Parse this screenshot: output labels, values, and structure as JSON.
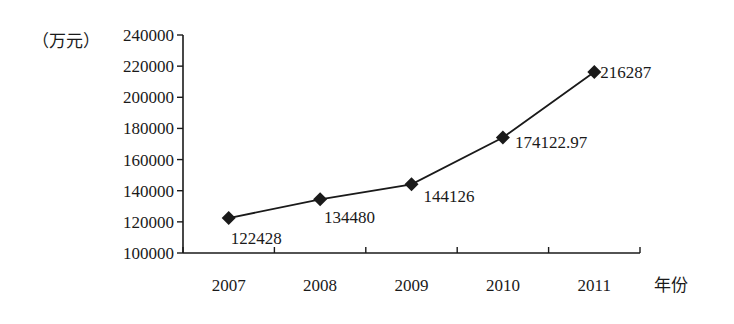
{
  "chart_data": {
    "type": "line",
    "title": "",
    "ylabel": "（万元）",
    "xlabel": "年份",
    "categories": [
      "2007",
      "2008",
      "2009",
      "2010",
      "2011"
    ],
    "series": [
      {
        "name": "",
        "values": [
          122428,
          134480,
          144126,
          174122.97,
          216287
        ],
        "labels": [
          "122428",
          "134480",
          "144126",
          "174122.97",
          "216287"
        ],
        "marker": "diamond",
        "color": "#1a1a1a"
      }
    ],
    "ylim": [
      100000,
      240000
    ],
    "yticks": [
      "100000",
      "120000",
      "140000",
      "160000",
      "180000",
      "200000",
      "220000",
      "240000"
    ],
    "grid": false,
    "legend": "none"
  }
}
